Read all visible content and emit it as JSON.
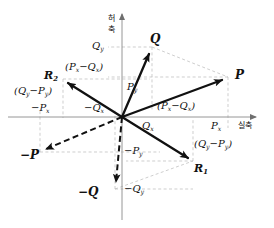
{
  "figure": {
    "kind": "complex-plane-vector-diagram",
    "background": "#ffffff",
    "axis_color": "#8a8a8a",
    "vector_color": "#111111",
    "guide_color": "#b9b9b9",
    "width": 274,
    "height": 228
  },
  "axes": {
    "real_axis_label": "실축",
    "imaginary_axis_label": "허축",
    "imaginary_axis_label_chars": [
      "허",
      "축"
    ],
    "origin": {
      "x": 122,
      "y": 117
    }
  },
  "vectors": [
    {
      "name": "P",
      "label": "P",
      "style": "solid",
      "tip": {
        "x": 228,
        "y": 77
      }
    },
    {
      "name": "Q",
      "label": "Q",
      "style": "solid",
      "tip": {
        "x": 152,
        "y": 47
      }
    },
    {
      "name": "R1",
      "label": "R",
      "sub": "1",
      "style": "solid",
      "tip": {
        "x": 193,
        "y": 161
      }
    },
    {
      "name": "R2",
      "label": "R",
      "sub": "2",
      "style": "solid",
      "tip": {
        "x": 63,
        "y": 79
      }
    },
    {
      "name": "-P",
      "label": "−P",
      "style": "dashed",
      "tip": {
        "x": 40,
        "y": 152
      }
    },
    {
      "name": "-Q",
      "label": "−Q",
      "style": "dashed",
      "tip": {
        "x": 115,
        "y": 189
      }
    }
  ],
  "tick_labels": {
    "Px": "P",
    "Px_sub": "x",
    "Py": "P",
    "Py_sub": "y",
    "Qx": "Q",
    "Qx_sub": "x",
    "Qy": "Q",
    "Qy_sub": "y",
    "neg_Px": "−P",
    "neg_Px_sub": "x",
    "neg_Py": "−P",
    "neg_Py_sub": "y",
    "neg_Qx": "−Q",
    "neg_Qx_sub": "x",
    "neg_Qy": "−Q",
    "neg_Qy_sub": "y"
  },
  "component_labels": [
    {
      "name": "px-minus-qx-upper",
      "open": "(",
      "base": "P",
      "sub1": "x",
      "mid": "−",
      "base2": "Q",
      "sub2": "x",
      "close": ")"
    },
    {
      "name": "px-minus-qx-lower",
      "open": "(",
      "base": "P",
      "sub1": "x",
      "mid": "−",
      "base2": "Q",
      "sub2": "x",
      "close": ")"
    },
    {
      "name": "qy-minus-py-left",
      "open": "(",
      "base": "Q",
      "sub1": "y",
      "mid": "−",
      "base2": "P",
      "sub2": "y",
      "close": ")"
    },
    {
      "name": "qy-minus-py-right",
      "open": "(",
      "base": "Q",
      "sub1": "y",
      "mid": "−",
      "base2": "P",
      "sub2": "y",
      "close": ")"
    }
  ],
  "text": {
    "P": "P",
    "Q": "Q",
    "R": "R",
    "one": "1",
    "two": "2",
    "neg_P": "−P",
    "neg_Q": "−Q",
    "x": "x",
    "y": "y",
    "minus": "−",
    "lparen": "(",
    "rparen": ")",
    "neg": "−",
    "kor_real": "실축",
    "kor_imag_1": "허",
    "kor_imag_2": "축"
  }
}
